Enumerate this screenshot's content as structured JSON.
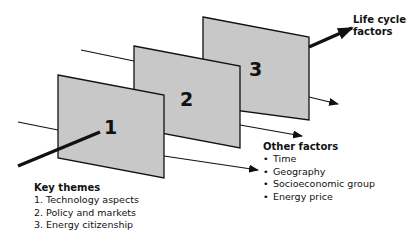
{
  "diagram": {
    "panels": [
      {
        "id": "1",
        "label": "1"
      },
      {
        "id": "2",
        "label": "2"
      },
      {
        "id": "3",
        "label": "3"
      }
    ],
    "panel_fill": "#c8c8c8",
    "stroke_color": "#111111"
  },
  "key_themes": {
    "title": "Key themes",
    "items": [
      "1. Technology aspects",
      "2. Policy and markets",
      "3. Energy citizenship"
    ]
  },
  "other_factors": {
    "title": "Other factors",
    "items": [
      "Time",
      "Geography",
      "Socioeconomic group",
      "Energy price"
    ]
  },
  "life_cycle": {
    "line1": "Life cycle",
    "line2": "factors"
  }
}
